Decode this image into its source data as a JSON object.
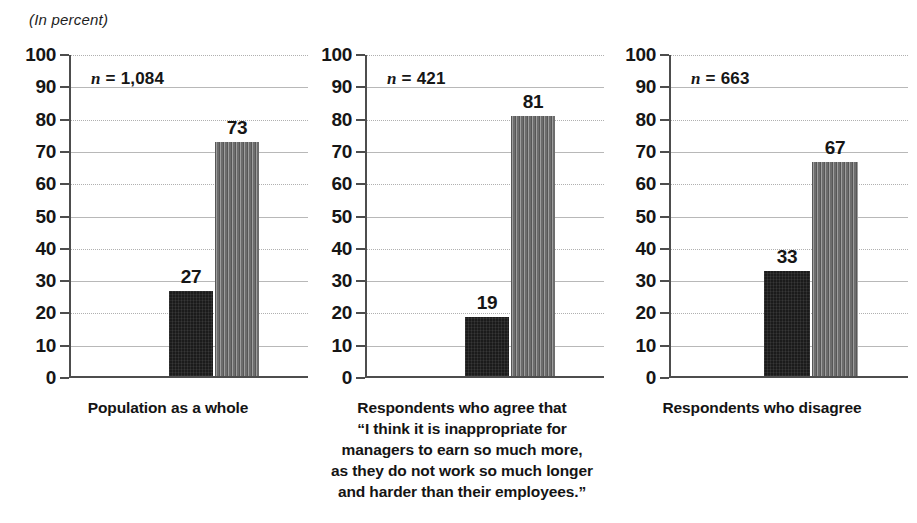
{
  "unit_label": "(In percent)",
  "axis": {
    "ticks": [
      "100",
      "90",
      "80",
      "70",
      "60",
      "50",
      "40",
      "30",
      "20",
      "10",
      "0"
    ]
  },
  "panels": [
    {
      "id": "population",
      "n_prefix": "n",
      "n_equals": " = ",
      "n_value": "1,084",
      "bars": [
        {
          "name": "bar-dark",
          "value": "27"
        },
        {
          "name": "bar-gray",
          "value": "73"
        }
      ],
      "caption": [
        "Population as a whole"
      ]
    },
    {
      "id": "agree",
      "n_prefix": "n",
      "n_equals": " = ",
      "n_value": "421",
      "bars": [
        {
          "name": "bar-dark",
          "value": "19"
        },
        {
          "name": "bar-gray",
          "value": "81"
        }
      ],
      "caption": [
        "Respondents who agree that",
        "“I think it is inappropriate for",
        "managers to earn so much more,",
        "as they do not work so much longer",
        "and harder than their employees.”"
      ]
    },
    {
      "id": "disagree",
      "n_prefix": "n",
      "n_equals": " = ",
      "n_value": "663",
      "bars": [
        {
          "name": "bar-dark",
          "value": "33"
        },
        {
          "name": "bar-gray",
          "value": "67"
        }
      ],
      "caption": [
        "Respondents who disagree"
      ]
    }
  ],
  "chart_data": {
    "type": "bar",
    "title": "",
    "subtitle": "",
    "xlabel": "",
    "ylabel": "(In percent)",
    "ylim": [
      0,
      100
    ],
    "ytick_step": 10,
    "yticks": [
      0,
      10,
      20,
      30,
      40,
      50,
      60,
      70,
      80,
      90,
      100
    ],
    "grid": "horizontal gridlines; dotted at 20/40/60/80/100, solid at 10/30/50/70/90",
    "legend": "none",
    "panels": [
      {
        "category": "Population as a whole",
        "n": 1084,
        "n_label": "n = 1,084",
        "values": [
          27,
          73
        ],
        "bar_styles": [
          "dark-speckled",
          "gray-striped"
        ]
      },
      {
        "category": "Respondents who agree that “I think it is inappropriate for managers to earn so much more, as they do not work so much longer and harder than their employees.”",
        "n": 421,
        "n_label": "n = 421",
        "values": [
          19,
          81
        ],
        "bar_styles": [
          "dark-speckled",
          "gray-striped"
        ]
      },
      {
        "category": "Respondents who disagree",
        "n": 663,
        "n_label": "n = 663",
        "values": [
          33,
          67
        ],
        "bar_styles": [
          "dark-speckled",
          "gray-striped"
        ]
      }
    ],
    "colors": {
      "bar_dark": "#1b1b1b",
      "bar_gray": "#7c7c7c",
      "axis": "#4d4d4d",
      "gridline": "#b8b8b8",
      "text": "#161616",
      "background": "#ffffff"
    }
  }
}
